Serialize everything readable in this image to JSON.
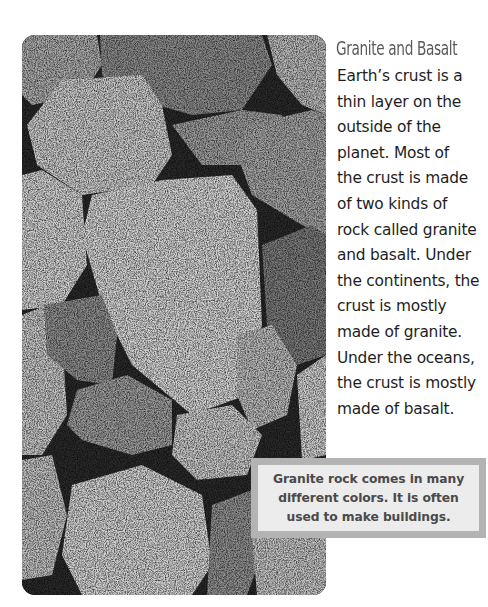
{
  "page": {
    "title": "Granite and Basalt",
    "body_lines": [
      "Earth’s crust is a",
      "thin layer on the",
      "outside of the",
      "planet.  Most of",
      "the crust is made",
      "of two kinds of",
      "rock called granite",
      "and basalt.  Under",
      "the continents, the",
      "crust is mostly",
      "made of granite.",
      "Under the oceans,",
      "the crust is mostly",
      "made of basalt."
    ],
    "caption_lines": [
      "Granite rock comes in many",
      "different colors.  It is often",
      "used to make buildings."
    ],
    "photo": {
      "subject": "pile of granite rocks (grayscale photo)"
    },
    "colors": {
      "title": "#5a5a5a",
      "body_text": "#1e1e1e",
      "caption_border": "#b3b3b3",
      "caption_fill": "#ececec",
      "caption_text": "#4a4a4a"
    }
  }
}
